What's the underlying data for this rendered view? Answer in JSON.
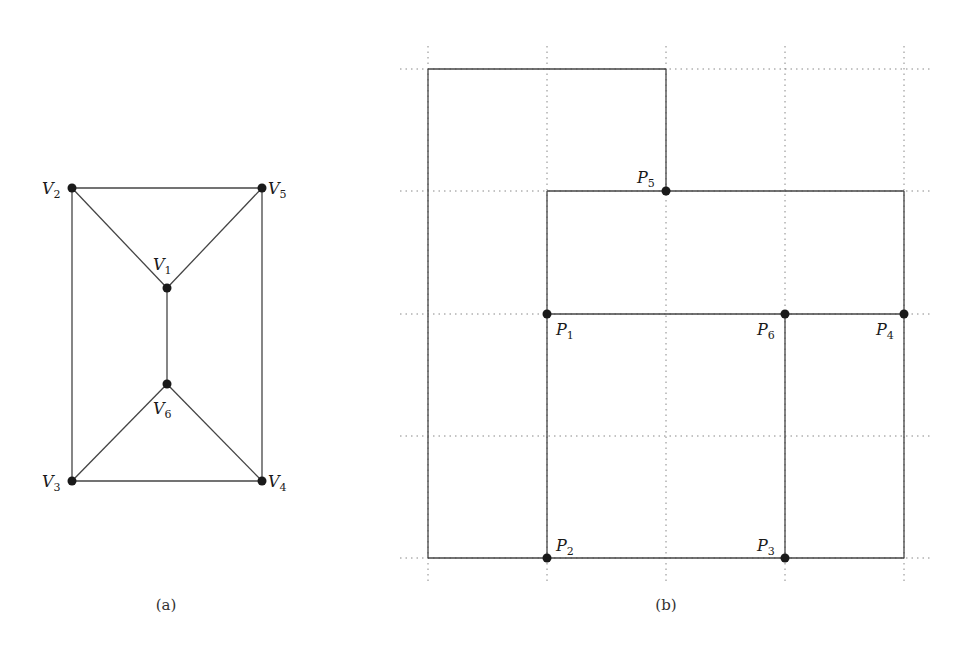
{
  "panels": [
    {
      "id": "a",
      "caption": "(a)",
      "vertices": [
        {
          "name": "V",
          "sub": "1",
          "x": 167,
          "y": 288,
          "lx": 153,
          "ly": 270
        },
        {
          "name": "V",
          "sub": "2",
          "x": 72,
          "y": 188,
          "lx": 42,
          "ly": 194
        },
        {
          "name": "V",
          "sub": "3",
          "x": 72,
          "y": 481,
          "lx": 42,
          "ly": 487
        },
        {
          "name": "V",
          "sub": "4",
          "x": 262,
          "y": 481,
          "lx": 268,
          "ly": 487
        },
        {
          "name": "V",
          "sub": "5",
          "x": 262,
          "y": 188,
          "lx": 268,
          "ly": 194
        },
        {
          "name": "V",
          "sub": "6",
          "x": 167,
          "y": 384,
          "lx": 153,
          "ly": 414
        }
      ],
      "edges": [
        [
          "V2",
          "V5"
        ],
        [
          "V2",
          "V1"
        ],
        [
          "V5",
          "V1"
        ],
        [
          "V1",
          "V6"
        ],
        [
          "V2",
          "V3"
        ],
        [
          "V5",
          "V4"
        ],
        [
          "V6",
          "V3"
        ],
        [
          "V6",
          "V4"
        ],
        [
          "V3",
          "V4"
        ]
      ]
    },
    {
      "id": "b",
      "caption": "(b)",
      "grid": {
        "columns": [
          428,
          547,
          666,
          785,
          904
        ],
        "rows": [
          69,
          191,
          314,
          436,
          558
        ],
        "x_extent": [
          400,
          932
        ],
        "y_extent": [
          46,
          582
        ]
      },
      "points": [
        {
          "name": "P",
          "sub": "1",
          "x": 547,
          "y": 314,
          "lx": 556,
          "ly": 335
        },
        {
          "name": "P",
          "sub": "2",
          "x": 547,
          "y": 558,
          "lx": 556,
          "ly": 551
        },
        {
          "name": "P",
          "sub": "3",
          "x": 785,
          "y": 558,
          "lx": 757,
          "ly": 551
        },
        {
          "name": "P",
          "sub": "4",
          "x": 904,
          "y": 314,
          "lx": 876,
          "ly": 335
        },
        {
          "name": "P",
          "sub": "5",
          "x": 666,
          "y": 191,
          "lx": 637,
          "ly": 183
        },
        {
          "name": "P",
          "sub": "6",
          "x": 785,
          "y": 314,
          "lx": 757,
          "ly": 335
        }
      ],
      "segments": [
        [
          428,
          69,
          666,
          69
        ],
        [
          666,
          69,
          666,
          191
        ],
        [
          428,
          69,
          428,
          558
        ],
        [
          428,
          558,
          904,
          558
        ],
        [
          547,
          191,
          904,
          191
        ],
        [
          547,
          191,
          547,
          558
        ],
        [
          904,
          191,
          904,
          558
        ],
        [
          547,
          314,
          904,
          314
        ],
        [
          785,
          314,
          785,
          558
        ]
      ]
    }
  ],
  "captions": {
    "a": "(a)",
    "b": "(b)"
  }
}
